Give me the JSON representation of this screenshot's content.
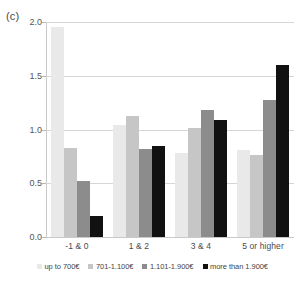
{
  "panel": {
    "label": "(c)"
  },
  "chart_data": {
    "type": "bar",
    "title": "",
    "subtitle": "",
    "xlabel": "",
    "ylabel": "",
    "ylim": [
      0.0,
      2.0
    ],
    "yticks": [
      "0.0",
      "0.5",
      "1.0",
      "1.5",
      "2.0"
    ],
    "ytick_values": [
      0.0,
      0.5,
      1.0,
      1.5,
      2.0
    ],
    "grid": true,
    "legend_position": "bottom",
    "categories": [
      "-1 & 0",
      "1 & 2",
      "3 & 4",
      "5 or higher"
    ],
    "series": [
      {
        "name": "up to 700€",
        "color": "#e9e9e9",
        "values": [
          1.95,
          1.04,
          0.78,
          0.81
        ]
      },
      {
        "name": "701-1.100€",
        "color": "#c6c6c6",
        "values": [
          0.83,
          1.13,
          1.01,
          0.76
        ]
      },
      {
        "name": "1.101-1.900€",
        "color": "#8c8c8c",
        "values": [
          0.52,
          0.82,
          1.18,
          1.27
        ]
      },
      {
        "name": "more than 1.900€",
        "color": "#111111",
        "values": [
          0.2,
          0.85,
          1.09,
          1.6
        ]
      }
    ]
  }
}
